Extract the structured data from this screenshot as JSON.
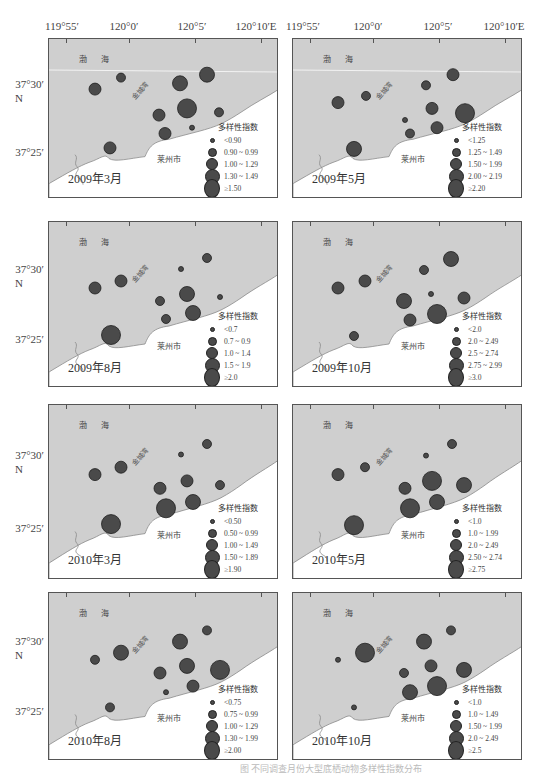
{
  "axes": {
    "longitude_labels": [
      "119°55′",
      "120°0′",
      "120°5′",
      "120°10′E"
    ],
    "latitude_labels": [
      "37°30′\nN",
      "37°25′"
    ],
    "lat_30": "37°30′",
    "lat_n": "N",
    "lat_25": "37°25′"
  },
  "map_labels": {
    "sea": "渤 海",
    "bay": "金城湾",
    "city": "莱州市"
  },
  "legend_title": "多样性指数",
  "caption": "图  不同调查月份大型底栖动物多样性指数分布",
  "colors": {
    "sea": "#cfcfcf",
    "land": "#ffffff",
    "station_fill": "#4a4a4a",
    "station_stroke": "#1e1e1e",
    "coast": "#8a8a8a"
  },
  "chart_data": {
    "type": "scatter",
    "xlabel": "Longitude",
    "ylabel": "Latitude",
    "x_ticks": [
      "119°55′",
      "120°0′",
      "120°5′",
      "120°10′E"
    ],
    "y_ticks": [
      "37°25′",
      "37°30′N"
    ],
    "panels": [
      {
        "title": "2009年3月",
        "legend": [
          "<0.90",
          "0.90 ~ 0.99",
          "1.00 ~ 1.29",
          "1.30 ~ 1.49",
          "≥1.50"
        ],
        "stations": [
          {
            "x": 46,
            "y": 52,
            "class": 2
          },
          {
            "x": 72,
            "y": 40,
            "class": 1
          },
          {
            "x": 131,
            "y": 46,
            "class": 3
          },
          {
            "x": 158,
            "y": 37,
            "class": 3
          },
          {
            "x": 138,
            "y": 72,
            "class": 4
          },
          {
            "x": 110,
            "y": 79,
            "class": 2
          },
          {
            "x": 170,
            "y": 76,
            "class": 1
          },
          {
            "x": 143,
            "y": 92,
            "class": 0
          },
          {
            "x": 116,
            "y": 98,
            "class": 2
          },
          {
            "x": 61,
            "y": 113,
            "class": 2
          }
        ]
      },
      {
        "title": "2009年5月",
        "legend": [
          "<1.25",
          "1.25 ~ 1.49",
          "1.50 ~ 1.99",
          "2.00 ~ 2.19",
          "≥2.20"
        ],
        "stations": [
          {
            "x": 45,
            "y": 66,
            "class": 2
          },
          {
            "x": 73,
            "y": 59,
            "class": 1
          },
          {
            "x": 133,
            "y": 48,
            "class": 1
          },
          {
            "x": 160,
            "y": 37,
            "class": 2
          },
          {
            "x": 139,
            "y": 72,
            "class": 2
          },
          {
            "x": 112,
            "y": 84,
            "class": 0
          },
          {
            "x": 172,
            "y": 77,
            "class": 4
          },
          {
            "x": 144,
            "y": 92,
            "class": 2
          },
          {
            "x": 117,
            "y": 98,
            "class": 1
          },
          {
            "x": 61,
            "y": 114,
            "class": 3
          }
        ]
      },
      {
        "title": "2009年8月",
        "legend": [
          "<0.7",
          "0.7 ~ 0.9",
          "1.0 ~ 1.4",
          "1.5 ~ 1.9",
          "≥2.0"
        ],
        "stations": [
          {
            "x": 46,
            "y": 66,
            "class": 2
          },
          {
            "x": 72,
            "y": 59,
            "class": 2
          },
          {
            "x": 132,
            "y": 47,
            "class": 0
          },
          {
            "x": 158,
            "y": 36,
            "class": 1
          },
          {
            "x": 138,
            "y": 72,
            "class": 3
          },
          {
            "x": 111,
            "y": 79,
            "class": 1
          },
          {
            "x": 171,
            "y": 75,
            "class": 0
          },
          {
            "x": 144,
            "y": 91,
            "class": 3
          },
          {
            "x": 117,
            "y": 97,
            "class": 1
          },
          {
            "x": 62,
            "y": 113,
            "class": 4
          }
        ]
      },
      {
        "title": "2009年10月",
        "legend": [
          "<2.0",
          "2.0 ~ 2.49",
          "2.5 ~ 2.74",
          "2.75 ~ 2.99",
          "≥3.0"
        ],
        "stations": [
          {
            "x": 45,
            "y": 66,
            "class": 2
          },
          {
            "x": 72,
            "y": 59,
            "class": 2
          },
          {
            "x": 131,
            "y": 48,
            "class": 1
          },
          {
            "x": 158,
            "y": 37,
            "class": 3
          },
          {
            "x": 138,
            "y": 72,
            "class": 0
          },
          {
            "x": 111,
            "y": 79,
            "class": 3
          },
          {
            "x": 171,
            "y": 76,
            "class": 2
          },
          {
            "x": 144,
            "y": 92,
            "class": 4
          },
          {
            "x": 117,
            "y": 98,
            "class": 2
          },
          {
            "x": 61,
            "y": 114,
            "class": 1
          }
        ]
      },
      {
        "title": "2010年3月",
        "legend": [
          "<0.50",
          "0.50 ~ 0.99",
          "1.00 ~ 1.49",
          "1.50 ~ 1.89",
          "≥1.90"
        ],
        "stations": [
          {
            "x": 46,
            "y": 66,
            "class": 2
          },
          {
            "x": 72,
            "y": 59,
            "class": 2
          },
          {
            "x": 132,
            "y": 47,
            "class": 0
          },
          {
            "x": 158,
            "y": 37,
            "class": 1
          },
          {
            "x": 138,
            "y": 72,
            "class": 2
          },
          {
            "x": 111,
            "y": 79,
            "class": 2
          },
          {
            "x": 171,
            "y": 76,
            "class": 1
          },
          {
            "x": 144,
            "y": 92,
            "class": 3
          },
          {
            "x": 117,
            "y": 98,
            "class": 4
          },
          {
            "x": 62,
            "y": 113,
            "class": 4
          }
        ]
      },
      {
        "title": "2010年5月",
        "legend": [
          "<1.0",
          "1.0 ~ 1.99",
          "2.0 ~ 2.49",
          "2.50 ~ 2.74",
          "≥2.75"
        ],
        "stations": [
          {
            "x": 45,
            "y": 66,
            "class": 2
          },
          {
            "x": 72,
            "y": 59,
            "class": 1
          },
          {
            "x": 133,
            "y": 48,
            "class": 0
          },
          {
            "x": 159,
            "y": 37,
            "class": 1
          },
          {
            "x": 139,
            "y": 72,
            "class": 4
          },
          {
            "x": 112,
            "y": 79,
            "class": 2
          },
          {
            "x": 171,
            "y": 76,
            "class": 3
          },
          {
            "x": 144,
            "y": 92,
            "class": 3
          },
          {
            "x": 117,
            "y": 98,
            "class": 4
          },
          {
            "x": 61,
            "y": 114,
            "class": 4
          }
        ]
      },
      {
        "title": "2010年8月",
        "legend": [
          "<0.75",
          "0.75 ~ 0.99",
          "1.00 ~ 1.29",
          "1.30 ~ 1.99",
          "≥2.00"
        ],
        "stations": [
          {
            "x": 46,
            "y": 66,
            "class": 1
          },
          {
            "x": 72,
            "y": 59,
            "class": 3
          },
          {
            "x": 131,
            "y": 48,
            "class": 3
          },
          {
            "x": 158,
            "y": 37,
            "class": 1
          },
          {
            "x": 138,
            "y": 72,
            "class": 3
          },
          {
            "x": 111,
            "y": 79,
            "class": 2
          },
          {
            "x": 171,
            "y": 76,
            "class": 4
          },
          {
            "x": 144,
            "y": 92,
            "class": 2
          },
          {
            "x": 117,
            "y": 98,
            "class": 0
          },
          {
            "x": 61,
            "y": 113,
            "class": 1
          }
        ]
      },
      {
        "title": "2010年10月",
        "legend": [
          "<1.0",
          "1.0 ~ 1.49",
          "1.50 ~ 1.99",
          "2.0 ~ 2.49",
          "≥2.5"
        ],
        "stations": [
          {
            "x": 45,
            "y": 66,
            "class": 0
          },
          {
            "x": 72,
            "y": 59,
            "class": 4
          },
          {
            "x": 131,
            "y": 48,
            "class": 3
          },
          {
            "x": 158,
            "y": 37,
            "class": 1
          },
          {
            "x": 138,
            "y": 72,
            "class": 2
          },
          {
            "x": 111,
            "y": 79,
            "class": 1
          },
          {
            "x": 171,
            "y": 76,
            "class": 3
          },
          {
            "x": 144,
            "y": 92,
            "class": 4
          },
          {
            "x": 117,
            "y": 98,
            "class": 3
          },
          {
            "x": 61,
            "y": 113,
            "class": 0
          }
        ]
      }
    ],
    "size_classes_px_radius": [
      2.5,
      4.5,
      6,
      7.5,
      9.5
    ]
  }
}
